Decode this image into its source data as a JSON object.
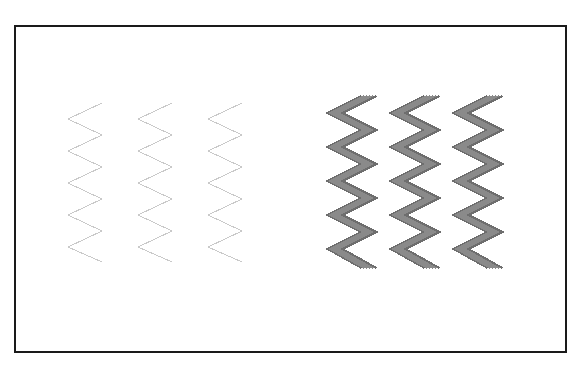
{
  "figure": {
    "canvas": {
      "width": 581,
      "height": 378,
      "background_color": "#ffffff"
    },
    "frame": {
      "name": "outer-border-rectangle",
      "x": 14,
      "y": 25,
      "width": 553,
      "height": 328,
      "stroke_color": "#1a1a1a",
      "stroke_width": 2,
      "fill_color": "#ffffff"
    }
  },
  "chart_data": {
    "type": "line",
    "subtitle": "Three faint single-stroke zigzags at left, three bold multi-stroke zigzags at right",
    "xlabel": "",
    "ylabel": "",
    "grid": false,
    "legend": "none",
    "xlim": [
      0,
      581
    ],
    "ylim": [
      0,
      378
    ],
    "group_count": 2,
    "series": [
      {
        "name": "thin-zigzag-1",
        "group": "low-contrast-left",
        "stroke_color": "#c9c9c9",
        "stroke_width": 1,
        "stroke_count": 1,
        "periods": 5,
        "amplitude": 17,
        "period_height": 33,
        "center_x": 85,
        "top_y": 103,
        "bottom_y": 262,
        "x": [
          102,
          68,
          102,
          68,
          102,
          68,
          102,
          68,
          102,
          68,
          102
        ],
        "y": [
          103,
          119,
          135,
          151,
          167,
          183,
          199,
          215,
          231,
          247,
          262
        ]
      },
      {
        "name": "thin-zigzag-2",
        "group": "low-contrast-left",
        "stroke_color": "#c9c9c9",
        "stroke_width": 1,
        "stroke_count": 1,
        "periods": 5,
        "amplitude": 17,
        "period_height": 33,
        "center_x": 155,
        "top_y": 103,
        "bottom_y": 262,
        "x": [
          172,
          138,
          172,
          138,
          172,
          138,
          172,
          138,
          172,
          138,
          172
        ],
        "y": [
          103,
          119,
          135,
          151,
          167,
          183,
          199,
          215,
          231,
          247,
          262
        ]
      },
      {
        "name": "thin-zigzag-3",
        "group": "low-contrast-left",
        "stroke_color": "#c9c9c9",
        "stroke_width": 1,
        "stroke_count": 1,
        "periods": 5,
        "amplitude": 17,
        "period_height": 33,
        "center_x": 225,
        "top_y": 103,
        "bottom_y": 262,
        "x": [
          242,
          208,
          242,
          208,
          242,
          208,
          242,
          208,
          242,
          208,
          242
        ],
        "y": [
          103,
          119,
          135,
          151,
          167,
          183,
          199,
          215,
          231,
          247,
          262
        ]
      },
      {
        "name": "thick-zigzag-1",
        "group": "high-contrast-right",
        "stroke_color": "#8a8a8a",
        "edge_color": "#6e6e6e",
        "stroke_width": 2,
        "stroke_count": 6,
        "stroke_spacing": 3,
        "band_width": 17,
        "periods": 5,
        "amplitude": 17,
        "period_height": 34,
        "center_x": 352,
        "top_y": 96,
        "bottom_y": 268,
        "x": [
          369,
          335,
          369,
          335,
          369,
          335,
          369,
          335,
          369,
          335,
          369
        ],
        "y": [
          96,
          113,
          130,
          147,
          164,
          181,
          198,
          215,
          232,
          249,
          268
        ]
      },
      {
        "name": "thick-zigzag-2",
        "group": "high-contrast-right",
        "stroke_color": "#8a8a8a",
        "edge_color": "#6e6e6e",
        "stroke_width": 2,
        "stroke_count": 6,
        "stroke_spacing": 3,
        "band_width": 17,
        "periods": 5,
        "amplitude": 17,
        "period_height": 34,
        "center_x": 415,
        "top_y": 96,
        "bottom_y": 268,
        "x": [
          432,
          398,
          432,
          398,
          432,
          398,
          432,
          398,
          432,
          398,
          432
        ],
        "y": [
          96,
          113,
          130,
          147,
          164,
          181,
          198,
          215,
          232,
          249,
          268
        ]
      },
      {
        "name": "thick-zigzag-3",
        "group": "high-contrast-right",
        "stroke_color": "#8a8a8a",
        "edge_color": "#6e6e6e",
        "stroke_width": 2,
        "stroke_count": 6,
        "stroke_spacing": 3,
        "band_width": 17,
        "periods": 5,
        "amplitude": 17,
        "period_height": 34,
        "center_x": 478,
        "top_y": 96,
        "bottom_y": 268,
        "x": [
          495,
          461,
          495,
          461,
          495,
          461,
          495,
          461,
          495,
          461,
          495
        ],
        "y": [
          96,
          113,
          130,
          147,
          164,
          181,
          198,
          215,
          232,
          249,
          268
        ]
      }
    ],
    "annotations": []
  }
}
